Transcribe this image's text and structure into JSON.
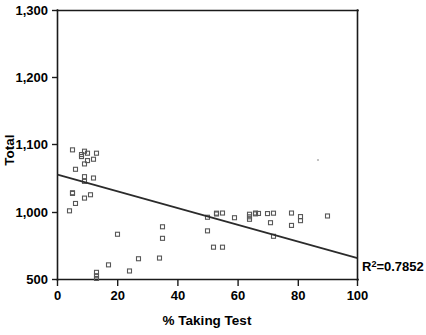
{
  "chart_data": {
    "type": "scatter",
    "title": "",
    "xlabel": "% Taking Test",
    "ylabel": "Total",
    "xlim": [
      0,
      100
    ],
    "ylim": [
      500,
      1300
    ],
    "grid": false,
    "legend": false,
    "x_ticks": [
      "0",
      "20",
      "40",
      "60",
      "80",
      "100"
    ],
    "x_tick_values": [
      0,
      20,
      40,
      60,
      80,
      100
    ],
    "y_ticks": [
      "500",
      "1,000",
      "1,100",
      "1,200",
      "1,300"
    ],
    "y_tick_values": [
      500,
      1000,
      1100,
      1200,
      1300
    ],
    "y_axis_note": "non-linear break between 500 and 1,000",
    "marker_style": "open-square",
    "points": [
      {
        "x": 4,
        "y": 1199
      },
      {
        "x": 5,
        "y": 1173
      },
      {
        "x": 6,
        "y": 1188
      },
      {
        "x": 5,
        "y": 1172
      },
      {
        "x": 9,
        "y": 1180
      },
      {
        "x": 11,
        "y": 1175
      },
      {
        "x": 9,
        "y": 1155
      },
      {
        "x": 9,
        "y": 1148
      },
      {
        "x": 12,
        "y": 1150
      },
      {
        "x": 6,
        "y": 1137
      },
      {
        "x": 9,
        "y": 1129
      },
      {
        "x": 10,
        "y": 1124
      },
      {
        "x": 12,
        "y": 1122
      },
      {
        "x": 8,
        "y": 1118
      },
      {
        "x": 8,
        "y": 1115
      },
      {
        "x": 10,
        "y": 1113
      },
      {
        "x": 9,
        "y": 1110
      },
      {
        "x": 13,
        "y": 1113
      },
      {
        "x": 5,
        "y": 1108
      },
      {
        "x": 13,
        "y": 1097
      },
      {
        "x": 13,
        "y": 1093
      },
      {
        "x": 13,
        "y": 1088
      },
      {
        "x": 17,
        "y": 1077
      },
      {
        "x": 24,
        "y": 1086
      },
      {
        "x": 27,
        "y": 1068
      },
      {
        "x": 34,
        "y": 1067
      },
      {
        "x": 20,
        "y": 1032
      },
      {
        "x": 35,
        "y": 1038
      },
      {
        "x": 35,
        "y": 1021
      },
      {
        "x": 52,
        "y": 1051
      },
      {
        "x": 55,
        "y": 1051
      },
      {
        "x": 50,
        "y": 1027
      },
      {
        "x": 50,
        "y": 1007
      },
      {
        "x": 53,
        "y": 1001
      },
      {
        "x": 53,
        "y": 989
      },
      {
        "x": 55,
        "y": 996
      },
      {
        "x": 59,
        "y": 961
      },
      {
        "x": 64,
        "y": 1010
      },
      {
        "x": 64,
        "y": 987
      },
      {
        "x": 64,
        "y": 968
      },
      {
        "x": 66,
        "y": 1002
      },
      {
        "x": 66,
        "y": 996
      },
      {
        "x": 67,
        "y": 993
      },
      {
        "x": 71,
        "y": 1015
      },
      {
        "x": 72,
        "y": 1035
      },
      {
        "x": 72,
        "y": 1001
      },
      {
        "x": 70,
        "y": 992
      },
      {
        "x": 78,
        "y": 1019
      },
      {
        "x": 78,
        "y": 996
      },
      {
        "x": 81,
        "y": 1012
      },
      {
        "x": 81,
        "y": 1006
      },
      {
        "x": 90,
        "y": 974
      }
    ],
    "trendline": {
      "x_start": 0,
      "y_start": 1145,
      "x_end": 100,
      "y_end": 660,
      "r_squared": 0.7852
    },
    "annotations": [
      {
        "name": "r-squared",
        "text_prefix": "R",
        "text_sup": "2",
        "text_suffix": "=0.7852"
      }
    ]
  }
}
